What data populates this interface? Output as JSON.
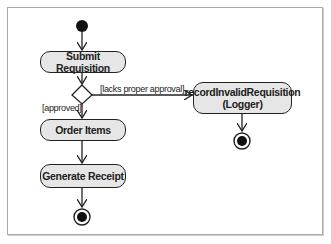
{
  "diagram": {
    "type": "UML activity diagram",
    "nodes": {
      "submit": "Submit Requisition",
      "order": "Order Items",
      "receipt": "Generate Receipt",
      "record_line1": "recordInvalidRequisition",
      "record_line2": "(Logger)"
    },
    "guards": {
      "reject": "[lacks proper approval]",
      "approve": "[approved]"
    },
    "colors": {
      "node_fill": "#e6e6e6",
      "stroke": "#222222",
      "frame": "#a9a9a9"
    }
  }
}
